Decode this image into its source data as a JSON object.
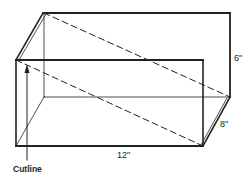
{
  "diagram": {
    "type": "box-with-cutline",
    "labels": {
      "height": "6\"",
      "depth": "8\"",
      "length": "12\"",
      "cutline": "Cutline"
    },
    "colors": {
      "stroke": "#222222",
      "background": "#ffffff"
    }
  }
}
